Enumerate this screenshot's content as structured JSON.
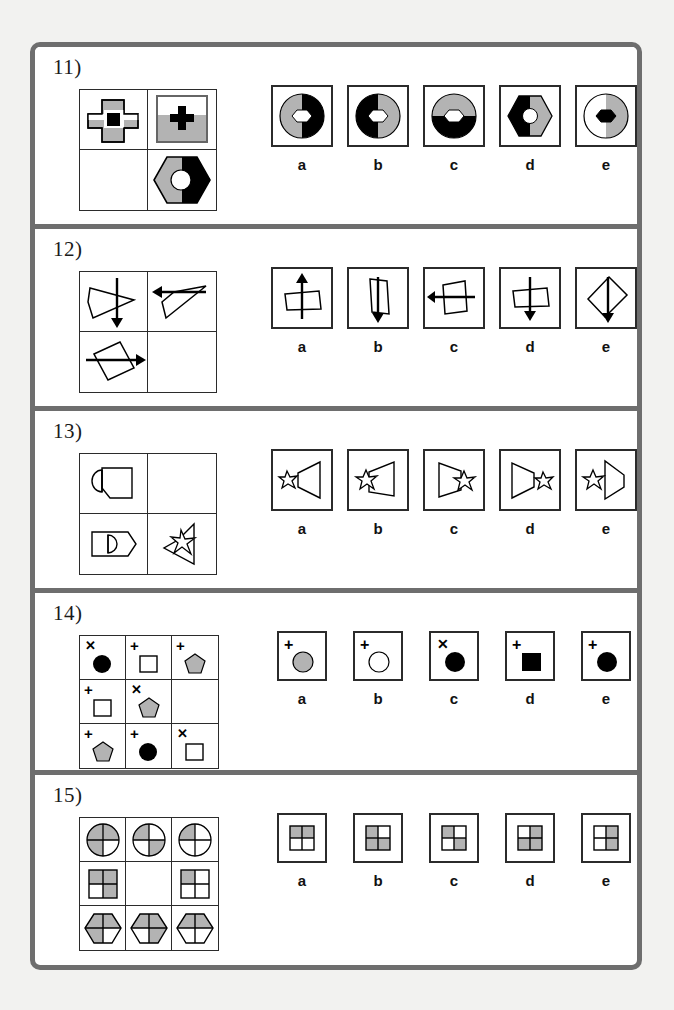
{
  "page": {
    "border_color": "#6e6e6e",
    "background": "#f2f2f0",
    "paper": "#ffffff",
    "ink": "#1a1a1a",
    "gray_fill": "#b3b3b3",
    "black_fill": "#000000"
  },
  "option_labels": [
    "a",
    "b",
    "c",
    "d",
    "e"
  ],
  "questions": [
    {
      "number": "11)",
      "matrix_type": "2x2",
      "matrix_cells": [
        {
          "name": "cross-gray-with-black-square",
          "shape": "cross",
          "fill": "gray",
          "inner": "black-square",
          "framed": false
        },
        {
          "name": "framed-gray-half-panel-with-black-cross",
          "shape": "cross",
          "fill": "black",
          "inner": "none",
          "framed": true
        },
        {
          "name": "empty-cell",
          "shape": "empty",
          "fill": "none",
          "inner": "none",
          "framed": false
        },
        {
          "name": "hexagon-gray-black-with-white-circle",
          "shape": "hexagon",
          "fill": "half-gray-half-black",
          "inner": "white-circle",
          "framed": false
        }
      ],
      "options": [
        {
          "label": "a",
          "name": "circle-gray-left-black-right-white-hexagon-center"
        },
        {
          "label": "b",
          "name": "circle-black-left-gray-right-white-hexagon-center"
        },
        {
          "label": "c",
          "name": "circle-gray-top-black-bottom-white-hexagon-center"
        },
        {
          "label": "d",
          "name": "hexagon-black-left-gray-right-white-circle-center"
        },
        {
          "label": "e",
          "name": "circle-white-left-gray-right-black-hexagon-center"
        }
      ]
    },
    {
      "number": "12)",
      "matrix_type": "2x2",
      "matrix_cells": [
        {
          "name": "triangle-with-down-arrow",
          "shape": "triangle-right",
          "arrow": "down"
        },
        {
          "name": "triangle-with-left-arrow",
          "shape": "triangle-tilt",
          "arrow": "left"
        },
        {
          "name": "rectangle-tilted-with-right-arrow",
          "shape": "rect-tilt",
          "arrow": "right"
        },
        {
          "name": "empty-cell",
          "shape": "empty",
          "arrow": "none"
        }
      ],
      "options": [
        {
          "label": "a",
          "name": "trapezoid-with-up-arrow"
        },
        {
          "label": "b",
          "name": "tall-rectangle-with-down-arrow"
        },
        {
          "label": "c",
          "name": "quadrilateral-with-left-arrow"
        },
        {
          "label": "d",
          "name": "trapezoid-with-down-arrow"
        },
        {
          "label": "e",
          "name": "tilted-rectangle-with-down-arrow"
        }
      ]
    },
    {
      "number": "13)",
      "matrix_type": "2x2",
      "matrix_cells": [
        {
          "name": "tag-shape-with-half-disc-left",
          "shape": "tag-left-halfdisc"
        },
        {
          "name": "empty-cell",
          "shape": "empty"
        },
        {
          "name": "pentagon-tag-with-half-disc",
          "shape": "tag-right-halfdisc"
        },
        {
          "name": "speaker-with-star",
          "shape": "speaker-star"
        }
      ],
      "options": [
        {
          "label": "a",
          "name": "speaker-right-facing-star-left-small"
        },
        {
          "label": "b",
          "name": "speaker-right-facing-star-left-overlap"
        },
        {
          "label": "c",
          "name": "speaker-left-facing-star-right-overlap"
        },
        {
          "label": "d",
          "name": "speaker-left-facing-star-right-separate"
        },
        {
          "label": "e",
          "name": "speaker-right-facing-wide-star-left"
        }
      ]
    },
    {
      "number": "14)",
      "matrix_type": "3x3",
      "matrix_cells": [
        {
          "name": "cell-x-black-circle",
          "mark": "x",
          "shape": "circle",
          "fill": "black"
        },
        {
          "name": "cell-plus-white-square",
          "mark": "plus",
          "shape": "square",
          "fill": "white"
        },
        {
          "name": "cell-plus-gray-pentagon",
          "mark": "plus",
          "shape": "pentagon",
          "fill": "gray"
        },
        {
          "name": "cell-plus-white-square",
          "mark": "plus",
          "shape": "square",
          "fill": "white"
        },
        {
          "name": "cell-x-gray-pentagon",
          "mark": "x",
          "shape": "pentagon",
          "fill": "gray"
        },
        {
          "name": "empty-cell",
          "mark": "none",
          "shape": "empty",
          "fill": "none"
        },
        {
          "name": "cell-plus-gray-pentagon",
          "mark": "plus",
          "shape": "pentagon",
          "fill": "gray"
        },
        {
          "name": "cell-plus-black-circle",
          "mark": "plus",
          "shape": "circle",
          "fill": "black"
        },
        {
          "name": "cell-x-white-square",
          "mark": "x",
          "shape": "square",
          "fill": "white"
        }
      ],
      "options": [
        {
          "label": "a",
          "name": "plus-gray-circle",
          "mark": "plus",
          "shape": "circle",
          "fill": "gray"
        },
        {
          "label": "b",
          "name": "plus-white-circle",
          "mark": "plus",
          "shape": "circle",
          "fill": "white"
        },
        {
          "label": "c",
          "name": "x-black-circle",
          "mark": "x",
          "shape": "circle",
          "fill": "black"
        },
        {
          "label": "d",
          "name": "plus-black-square",
          "mark": "plus",
          "shape": "square",
          "fill": "black"
        },
        {
          "label": "e",
          "name": "plus-black-circle",
          "mark": "plus",
          "shape": "circle",
          "fill": "black"
        }
      ]
    },
    {
      "number": "15)",
      "matrix_type": "3x3",
      "matrix_cells": [
        {
          "name": "circle-quadrants-tl-tr-bl-gray",
          "shape": "circle",
          "quadrants": [
            1,
            1,
            1,
            0
          ]
        },
        {
          "name": "circle-quadrants-tl-br-gray",
          "shape": "circle",
          "quadrants": [
            1,
            0,
            0,
            1
          ]
        },
        {
          "name": "circle-quadrant-tl-gray",
          "shape": "circle",
          "quadrants": [
            1,
            0,
            0,
            0
          ]
        },
        {
          "name": "square-quadrants-tl-tr-br-gray",
          "shape": "square",
          "quadrants": [
            1,
            1,
            0,
            1
          ]
        },
        {
          "name": "empty-cell",
          "shape": "empty",
          "quadrants": [
            0,
            0,
            0,
            0
          ]
        },
        {
          "name": "square-quadrant-tl-gray",
          "shape": "square",
          "quadrants": [
            1,
            0,
            0,
            0
          ]
        },
        {
          "name": "hexagon-quadrants-tl-tr-bl-gray",
          "shape": "hexagon",
          "quadrants": [
            1,
            1,
            1,
            0
          ]
        },
        {
          "name": "hexagon-quadrants-tl-tr-br-gray",
          "shape": "hexagon",
          "quadrants": [
            1,
            1,
            0,
            1
          ]
        },
        {
          "name": "hexagon-quadrants-tl-tr-gray",
          "shape": "hexagon",
          "quadrants": [
            1,
            1,
            0,
            0
          ]
        }
      ],
      "options": [
        {
          "label": "a",
          "name": "square-quadrants-tl-tr-gray",
          "quadrants": [
            1,
            1,
            0,
            0
          ]
        },
        {
          "label": "b",
          "name": "square-quadrants-tl-bl-br-gray",
          "quadrants": [
            1,
            0,
            1,
            1
          ]
        },
        {
          "label": "c",
          "name": "square-quadrants-tl-br-gray",
          "quadrants": [
            1,
            0,
            0,
            1
          ]
        },
        {
          "label": "d",
          "name": "square-quadrants-tr-bl-br-gray",
          "quadrants": [
            0,
            1,
            1,
            1
          ]
        },
        {
          "label": "e",
          "name": "square-quadrants-tr-br-gray",
          "quadrants": [
            0,
            1,
            0,
            1
          ]
        }
      ]
    }
  ]
}
